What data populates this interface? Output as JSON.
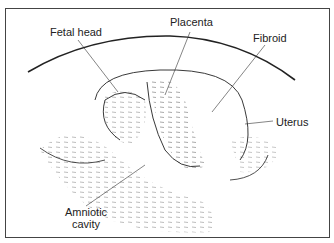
{
  "diagram": {
    "type": "annotated ultrasound sketch",
    "labels": {
      "fetal_head": "Fetal head",
      "placenta": "Placenta",
      "fibroid": "Fibroid",
      "uterus": "Uterus",
      "amniotic_cavity_line1": "Amniotic",
      "amniotic_cavity_line2": "cavity"
    },
    "colors": {
      "line": "#222222",
      "stipple": "#666666",
      "frame": "#444444",
      "background": "#ffffff"
    }
  }
}
